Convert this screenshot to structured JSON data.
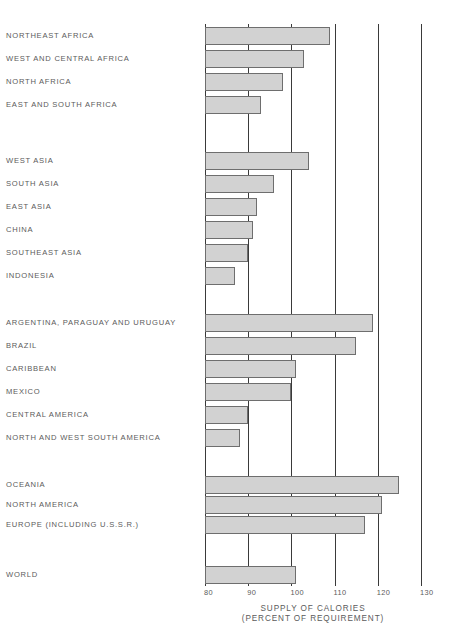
{
  "chart_data": {
    "type": "bar",
    "orientation": "horizontal",
    "title": "",
    "xlabel": "SUPPLY OF CALORIES (PERCENT OF REQUIREMENT)",
    "ylabel": "",
    "xlim": [
      80,
      130
    ],
    "xticks": [
      80,
      90,
      100,
      110,
      120,
      130
    ],
    "grid": "vertical",
    "legend": "none",
    "bar_color": "#d2d2d2",
    "bar_border_color": "#6e6e6e",
    "gridline_color": "#3a3a3a",
    "text_color": "#5b5b5b",
    "categories": [
      "NORTHEAST AFRICA",
      "WEST AND CENTRAL AFRICA",
      "NORTH AFRICA",
      "EAST AND SOUTH AFRICA",
      "WEST ASIA",
      "SOUTH ASIA",
      "EAST ASIA",
      "CHINA",
      "SOUTHEAST ASIA",
      "INDONESIA",
      "ARGENTINA, PARAGUAY AND URUGUAY",
      "BRAZIL",
      "CARIBBEAN",
      "MEXICO",
      "CENTRAL AMERICA",
      "NORTH AND WEST SOUTH AMERICA",
      "OCEANIA",
      "NORTH AMERICA",
      "EUROPE (INCLUDING U.S.S.R.)",
      "WORLD"
    ],
    "values": [
      109,
      103,
      98,
      93,
      104,
      96,
      92,
      91,
      90,
      87,
      119,
      115,
      101,
      100,
      90,
      88,
      125,
      121,
      117,
      101
    ],
    "groups": [
      {
        "name": "AFRICA",
        "indices": [
          0,
          1,
          2,
          3
        ]
      },
      {
        "name": "ASIA",
        "indices": [
          4,
          5,
          6,
          7,
          8,
          9
        ]
      },
      {
        "name": "LATIN AMERICA",
        "indices": [
          10,
          11,
          12,
          13,
          14,
          15
        ]
      },
      {
        "name": "DEVELOPED",
        "indices": [
          16,
          17,
          18
        ]
      },
      {
        "name": "TOTAL",
        "indices": [
          19
        ]
      }
    ],
    "axis_title_lines": [
      "SUPPLY OF CALORIES",
      "(PERCENT OF REQUIREMENT)"
    ],
    "rows": [
      {
        "label": "NORTHEAST AFRICA",
        "value": 109,
        "top": 27
      },
      {
        "label": "WEST AND CENTRAL AFRICA",
        "value": 103,
        "top": 50
      },
      {
        "label": "NORTH AFRICA",
        "value": 98,
        "top": 73
      },
      {
        "label": "EAST AND SOUTH AFRICA",
        "value": 93,
        "top": 96
      },
      {
        "label": "WEST ASIA",
        "value": 104,
        "top": 152
      },
      {
        "label": "SOUTH ASIA",
        "value": 96,
        "top": 175
      },
      {
        "label": "EAST ASIA",
        "value": 92,
        "top": 198
      },
      {
        "label": "CHINA",
        "value": 91,
        "top": 221
      },
      {
        "label": "SOUTHEAST ASIA",
        "value": 90,
        "top": 244
      },
      {
        "label": "INDONESIA",
        "value": 87,
        "top": 267
      },
      {
        "label": "ARGENTINA, PARAGUAY AND URUGUAY",
        "value": 119,
        "top": 314
      },
      {
        "label": "BRAZIL",
        "value": 115,
        "top": 337
      },
      {
        "label": "CARIBBEAN",
        "value": 101,
        "top": 360
      },
      {
        "label": "MEXICO",
        "value": 100,
        "top": 383
      },
      {
        "label": "CENTRAL AMERICA",
        "value": 90,
        "top": 406
      },
      {
        "label": "NORTH AND WEST SOUTH AMERICA",
        "value": 88,
        "top": 429
      },
      {
        "label": "OCEANIA",
        "value": 125,
        "top": 476
      },
      {
        "label": "NORTH AMERICA",
        "value": 121,
        "top": 496
      },
      {
        "label": "EUROPE (INCLUDING U.S.S.R.)",
        "value": 117,
        "top": 516
      },
      {
        "label": "WORLD",
        "value": 101,
        "top": 566
      }
    ]
  }
}
